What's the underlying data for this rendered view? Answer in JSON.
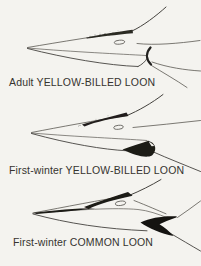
{
  "plate": {
    "background_color": "#f4f3ef",
    "ink_color": "#3c3a36",
    "dark_marking_color": "#1b1a17",
    "figures": [
      {
        "id": "adult-yellow-billed-loon",
        "label": "Adult YELLOW-BILLED LOON",
        "depicts": "pale unmarked loon bill profile with faint dusky culmen base"
      },
      {
        "id": "first-winter-yellow-billed-loon",
        "label": "First-winter YELLOW-BILLED LOON",
        "depicts": "pale loon bill profile with dark culmen-base patch and dusky rear lower mandible"
      },
      {
        "id": "first-winter-common-loon",
        "label": "First-winter COMMON LOON",
        "depicts": "loon bill profile with dark culmen ridge, dark cutting edge near tip and dark gape wedge"
      }
    ]
  }
}
